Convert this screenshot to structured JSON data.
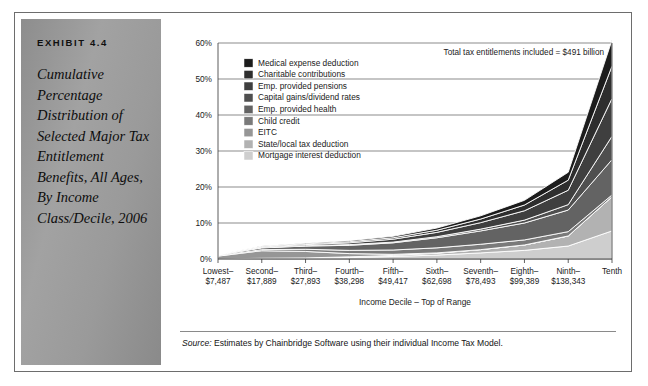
{
  "exhibit": {
    "number": "EXHIBIT 4.4",
    "title": "Cumulative Percentage Distribution of Selected Major Tax Entitlement Benefits, All Ages, By Income Class/Decile, 2006"
  },
  "annotation": "Total tax entitlements included = $491 billion",
  "source": {
    "prefix": "Source:",
    "text": "Estimates by Chainbridge Software using their individual Income Tax Model."
  },
  "chart_data": {
    "type": "area",
    "title": "",
    "subtitle": "",
    "xlabel": "Income Decile – Top of Range",
    "ylabel": "",
    "stacked": true,
    "grid": true,
    "legend_position": "inside-top-left",
    "ylim": [
      0,
      60
    ],
    "yticks": [
      0,
      10,
      20,
      30,
      40,
      50,
      60
    ],
    "ytick_labels": [
      "0%",
      "10%",
      "20%",
      "30%",
      "40%",
      "50%",
      "60%"
    ],
    "categories": [
      "Lowest–\n$7,487",
      "Second–\n$17,889",
      "Third–\n$27,893",
      "Fourth–\n$38,298",
      "Fifth–\n$49,417",
      "Sixth–\n$62,698",
      "Seventh–\n$78,493",
      "Eighth–\n$99,389",
      "Ninth–\n$138,343",
      "Tenth"
    ],
    "category_names": [
      "Lowest–",
      "Second–",
      "Third–",
      "Fourth–",
      "Fifth–",
      "Sixth–",
      "Seventh–",
      "Eighth–",
      "Ninth–",
      "Tenth"
    ],
    "category_values": [
      "$7,487",
      "$17,889",
      "$27,893",
      "$38,298",
      "$49,417",
      "$62,698",
      "$78,493",
      "$99,389",
      "$138,343",
      ""
    ],
    "series": [
      {
        "name": "Medical expense deduction",
        "color": "#1c1c1c",
        "values": [
          0.0,
          0.1,
          0.2,
          0.3,
          0.4,
          0.6,
          0.9,
          1.3,
          2.2,
          7.2
        ]
      },
      {
        "name": "Charitable contributions",
        "color": "#2e2e2e",
        "values": [
          0.0,
          0.1,
          0.2,
          0.3,
          0.4,
          0.6,
          1.0,
          1.6,
          2.8,
          9.0
        ]
      },
      {
        "name": "Emp. provided pensions",
        "color": "#3f3f3f",
        "values": [
          0.1,
          0.2,
          0.3,
          0.5,
          0.8,
          1.2,
          1.8,
          2.6,
          4.0,
          10.5
        ]
      },
      {
        "name": "Capital gains/dividend rates",
        "color": "#4f4f4f",
        "values": [
          0.0,
          0.1,
          0.1,
          0.2,
          0.2,
          0.3,
          0.5,
          0.8,
          1.5,
          6.5
        ]
      },
      {
        "name": "Emp. provided health",
        "color": "#636363",
        "values": [
          0.2,
          0.5,
          0.9,
          1.4,
          2.0,
          2.8,
          3.7,
          4.7,
          6.0,
          9.8
        ]
      },
      {
        "name": "Child credit",
        "color": "#7a7a7a",
        "values": [
          0.1,
          0.3,
          0.6,
          0.9,
          1.2,
          1.4,
          1.5,
          1.4,
          1.2,
          0.5
        ]
      },
      {
        "name": "EITC",
        "color": "#969696",
        "values": [
          0.8,
          2.1,
          1.8,
          0.9,
          0.3,
          0.1,
          0.0,
          0.0,
          0.0,
          0.0
        ]
      },
      {
        "name": "State/local tax deduction",
        "color": "#b2b2b2",
        "values": [
          0.0,
          0.1,
          0.1,
          0.2,
          0.3,
          0.5,
          0.9,
          1.5,
          2.8,
          9.5
        ]
      },
      {
        "name": "Mortgage interest deduction",
        "color": "#cecece",
        "values": [
          0.0,
          0.1,
          0.2,
          0.4,
          0.7,
          1.1,
          1.7,
          2.4,
          3.6,
          7.8
        ]
      }
    ],
    "totals": [
      1.2,
      3.6,
      4.4,
      5.1,
      6.3,
      8.6,
      12.0,
      16.3,
      24.1,
      60.8
    ],
    "annotation": "Total tax entitlements included = $491 billion"
  }
}
